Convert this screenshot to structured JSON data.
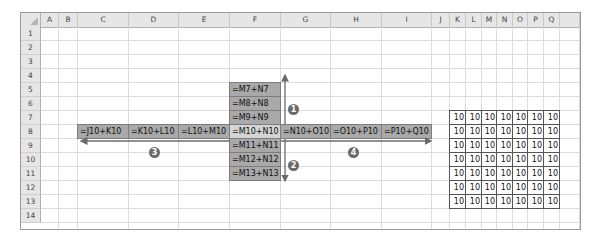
{
  "sheet": {
    "columns": [
      {
        "label": "A",
        "x": 20,
        "w": 18
      },
      {
        "label": "B",
        "x": 38,
        "w": 19
      },
      {
        "label": "C",
        "x": 57,
        "w": 51
      },
      {
        "label": "D",
        "x": 108,
        "w": 50
      },
      {
        "label": "E",
        "x": 158,
        "w": 51
      },
      {
        "label": "F",
        "x": 209,
        "w": 51
      },
      {
        "label": "G",
        "x": 260,
        "w": 50
      },
      {
        "label": "H",
        "x": 310,
        "w": 51
      },
      {
        "label": "I",
        "x": 361,
        "w": 50
      },
      {
        "label": "J",
        "x": 411,
        "w": 18
      },
      {
        "label": "K",
        "x": 429,
        "w": 16
      },
      {
        "label": "L",
        "x": 445,
        "w": 16
      },
      {
        "label": "M",
        "x": 461,
        "w": 15
      },
      {
        "label": "N",
        "x": 476,
        "w": 16
      },
      {
        "label": "O",
        "x": 492,
        "w": 15
      },
      {
        "label": "P",
        "x": 507,
        "w": 16
      },
      {
        "label": "Q",
        "x": 523,
        "w": 16
      },
      {
        "label": "",
        "x": 539,
        "w": 20
      }
    ],
    "rows": [
      "1",
      "2",
      "3",
      "4",
      "5",
      "6",
      "7",
      "8",
      "9",
      "10",
      "11",
      "12",
      "13",
      "14"
    ]
  },
  "formulas": {
    "vertical_up": [
      "=M7+N7",
      "=M8+N8",
      "=M9+N9"
    ],
    "center": "=M10+N10",
    "vertical_down": [
      "=M11+N11",
      "=M12+N12",
      "=M13+N13"
    ],
    "horizontal_left": [
      "=J10+K10",
      "=K10+L10",
      "=L10+M10"
    ],
    "horizontal_right": [
      "=N10+O10",
      "=O10+P10",
      "=P10+Q10"
    ]
  },
  "value_grid": {
    "rows": 7,
    "cols": 7,
    "value": "10",
    "start_row": 7,
    "columns": [
      "K",
      "L",
      "M",
      "N",
      "O",
      "P",
      "Q"
    ]
  },
  "annotations": [
    {
      "id": "1",
      "glyph": "1",
      "direction": "up"
    },
    {
      "id": "2",
      "glyph": "2",
      "direction": "down"
    },
    {
      "id": "3",
      "glyph": "3",
      "direction": "left"
    },
    {
      "id": "4",
      "glyph": "4",
      "direction": "right"
    }
  ],
  "colors": {
    "header_bg": "#e6e6e6",
    "formula_shade": "#a9a9a9",
    "center_shade": "#d4d4d4",
    "arrow": "#6a6a6a"
  }
}
